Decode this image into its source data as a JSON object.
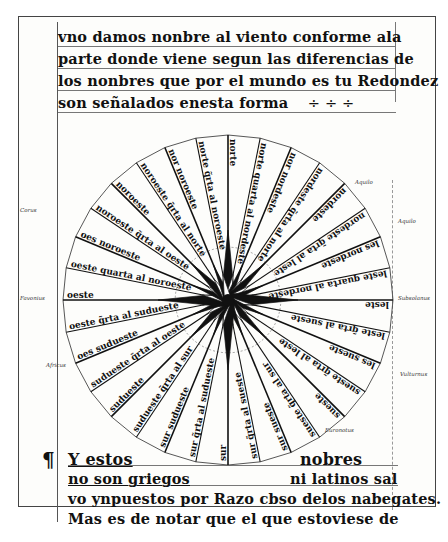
{
  "document": {
    "type": "manuscript page with wind rose",
    "top_text": [
      "vno damos nonbre al viento conforme ala",
      "parte donde viene segun las diferencias de",
      "los nonbres que por el mundo es tu Redondez",
      "son señalados enesta forma"
    ],
    "top_text_ornament": "÷  ÷  ÷",
    "bottom_text": {
      "pilcrow": "¶",
      "line1_left": "Y estos",
      "line1_right": "nobres",
      "line2_left": "no son griegos",
      "line2_right": "ni latinos sal",
      "line3": "vo ynpuestos por Razo cbso delos nabegates.",
      "line4": "Mas es de notar que el que estoviese de"
    }
  },
  "wind_rose": {
    "center_x": 228,
    "center_y": 300,
    "radius": 165,
    "label_color": "#111111",
    "line_color": "#111111",
    "winds": [
      {
        "angle": -90,
        "label": "norte"
      },
      {
        "angle": -78.75,
        "label": "norte quarta al nordeste"
      },
      {
        "angle": -67.5,
        "label": "nor nordeste"
      },
      {
        "angle": -56.25,
        "label": "nordeste q̃rta al norte"
      },
      {
        "angle": -45,
        "label": "nordeste"
      },
      {
        "angle": -33.75,
        "label": "nordeste q̃rta al leste"
      },
      {
        "angle": -22.5,
        "label": "les nordeste"
      },
      {
        "angle": -11.25,
        "label": "leste quarta al nordeste"
      },
      {
        "angle": 0,
        "label": "leste"
      },
      {
        "angle": 11.25,
        "label": "leste q̃rta al sueste"
      },
      {
        "angle": 22.5,
        "label": "les sueste"
      },
      {
        "angle": 33.75,
        "label": "sueste q̃rta al leste"
      },
      {
        "angle": 45,
        "label": "sueste"
      },
      {
        "angle": 56.25,
        "label": "sueste q̃rta al sur"
      },
      {
        "angle": 67.5,
        "label": "sur sueste"
      },
      {
        "angle": 78.75,
        "label": "sur q̃rta al sueste"
      },
      {
        "angle": 90,
        "label": "sur"
      },
      {
        "angle": 101.25,
        "label": "sur q̃rta al sudueste"
      },
      {
        "angle": 112.5,
        "label": "sur sudueste"
      },
      {
        "angle": 123.75,
        "label": "sudueste q̃rta al sur"
      },
      {
        "angle": 135,
        "label": "sudueste"
      },
      {
        "angle": 146.25,
        "label": "sudueste q̃rta al oeste"
      },
      {
        "angle": 157.5,
        "label": "oes sudueste"
      },
      {
        "angle": 168.75,
        "label": "oeste q̃rta al sudueste"
      },
      {
        "angle": 180,
        "label": "oeste"
      },
      {
        "angle": -168.75,
        "label": "oeste quarta al noroeste"
      },
      {
        "angle": -157.5,
        "label": "oes noroeste"
      },
      {
        "angle": -146.25,
        "label": "noroeste q̃rta al oeste"
      },
      {
        "angle": -135,
        "label": "noroeste"
      },
      {
        "angle": -123.75,
        "label": "noroeste q̃rta al norte"
      },
      {
        "angle": -112.5,
        "label": "nor noroeste"
      },
      {
        "angle": -101.25,
        "label": "norte q̃rta al noroeste"
      }
    ],
    "margin_notes": [
      {
        "x": 20,
        "y": 300,
        "text": "Favonius"
      },
      {
        "x": 398,
        "y": 300,
        "text": "Subsolanus"
      },
      {
        "x": 398,
        "y": 223,
        "text": "Aquilo"
      },
      {
        "x": 400,
        "y": 376,
        "text": "Vulturnus"
      },
      {
        "x": 46,
        "y": 367,
        "text": "Africus"
      },
      {
        "x": 20,
        "y": 212,
        "text": "Corus"
      },
      {
        "x": 355,
        "y": 184,
        "text": "Aquilo"
      },
      {
        "x": 325,
        "y": 432,
        "text": "Euronotus"
      }
    ]
  }
}
